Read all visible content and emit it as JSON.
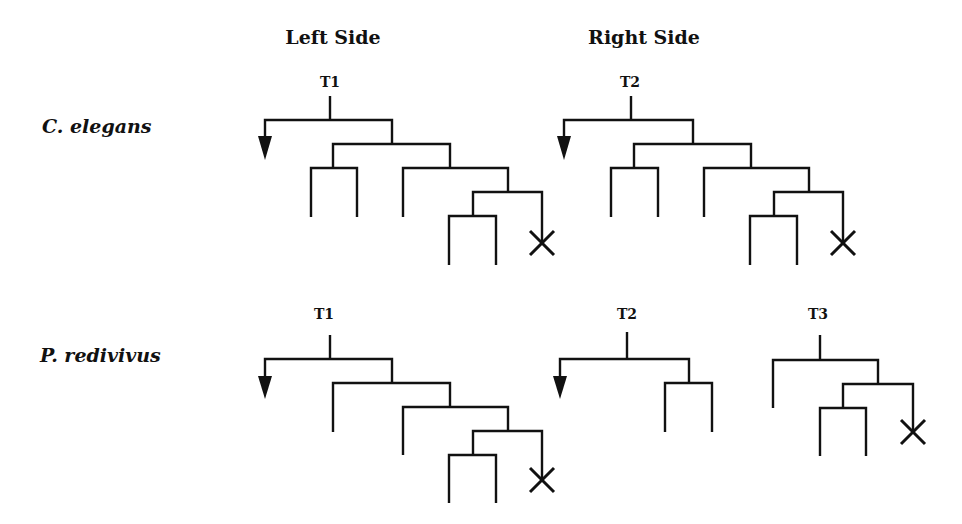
{
  "headings": {
    "left": "Left Side",
    "right": "Right Side"
  },
  "species": [
    {
      "name": "C. elegans"
    },
    {
      "name": "P. redivivus"
    }
  ],
  "lineages": {
    "c_elegans_left": {
      "label": "T1",
      "side": "Left Side",
      "species": "C. elegans",
      "terminal_death_marks": 1,
      "arrow": "anterior (down-left)"
    },
    "c_elegans_right": {
      "label": "T2",
      "side": "Right Side",
      "species": "C. elegans",
      "terminal_death_marks": 1,
      "arrow": "anterior (down-left)"
    },
    "p_redivivus_left": {
      "label": "T1",
      "side": "Left Side",
      "species": "P. redivivus",
      "terminal_death_marks": 1,
      "arrow": "anterior (down-left)"
    },
    "p_redivivus_right_t2": {
      "label": "T2",
      "side": "Right Side",
      "species": "P. redivivus",
      "terminal_death_marks": 0,
      "arrow": "anterior (down-left)"
    },
    "p_redivivus_right_t3": {
      "label": "T3",
      "side": "Right Side",
      "species": "P. redivivus",
      "terminal_death_marks": 1,
      "arrow": "none"
    }
  },
  "legend": {
    "arrow_meaning": "lineage continues",
    "x_meaning": "cell death"
  },
  "colors": {
    "ink": "#111111",
    "background": "#ffffff"
  }
}
